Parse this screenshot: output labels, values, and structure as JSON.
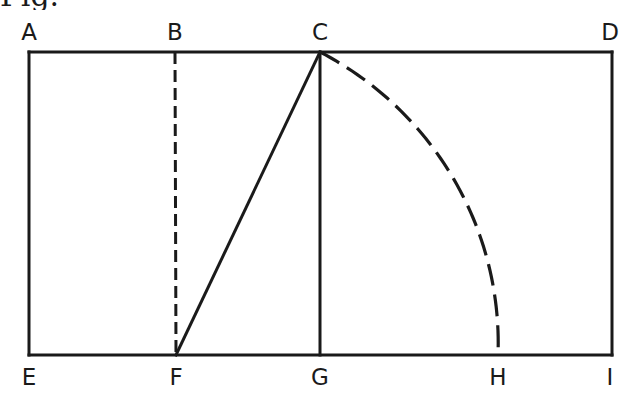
{
  "figure": {
    "caption_fragment": "Fig.",
    "points": [
      {
        "id": "A",
        "label": "A"
      },
      {
        "id": "B",
        "label": "B"
      },
      {
        "id": "C",
        "label": "C"
      },
      {
        "id": "D",
        "label": "D"
      },
      {
        "id": "E",
        "label": "E"
      },
      {
        "id": "F",
        "label": "F"
      },
      {
        "id": "G",
        "label": "G"
      },
      {
        "id": "H",
        "label": "H"
      },
      {
        "id": "I",
        "label": "I"
      }
    ],
    "segments": [
      {
        "from": "A",
        "to": "D",
        "style": "solid",
        "name": "top-edge-AD"
      },
      {
        "from": "E",
        "to": "I",
        "style": "solid",
        "name": "bottom-edge-EI"
      },
      {
        "from": "A",
        "to": "E",
        "style": "solid",
        "name": "left-edge-AE"
      },
      {
        "from": "D",
        "to": "I",
        "style": "solid",
        "name": "right-edge-DI"
      },
      {
        "from": "B",
        "to": "F",
        "style": "dashed",
        "name": "dashed-line-BF"
      },
      {
        "from": "C",
        "to": "G",
        "style": "solid",
        "name": "line-CG"
      },
      {
        "from": "F",
        "to": "C",
        "style": "solid",
        "name": "diagonal-FC"
      }
    ],
    "arcs": [
      {
        "center": "F",
        "from": "C",
        "to": "H",
        "style": "dashed",
        "name": "arc-CH"
      }
    ],
    "colors": {
      "stroke": "#1a1a1a",
      "background": "#ffffff"
    }
  }
}
